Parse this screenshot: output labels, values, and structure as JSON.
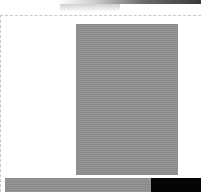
{
  "window": {
    "title": "",
    "icons": {
      "image": "image-placeholder",
      "progress": "progress-bar"
    }
  },
  "content": {
    "image_alt": "",
    "progress_bar": {
      "fill_fraction": 0.74
    }
  }
}
